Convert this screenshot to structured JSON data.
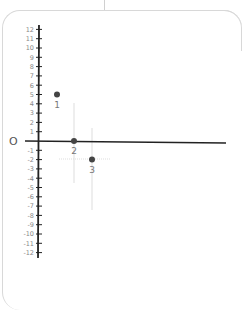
{
  "diagram": {
    "type": "number-line-plot",
    "origin_label": "O",
    "y_ticks": [
      12,
      11,
      10,
      9,
      8,
      7,
      6,
      5,
      4,
      3,
      2,
      1,
      -1,
      -2,
      -3,
      -4,
      -5,
      -6,
      -7,
      -8,
      -9,
      -10,
      -11,
      -12
    ],
    "points": [
      {
        "label": "1",
        "x_px": 57,
        "y_value": 5
      },
      {
        "label": "2",
        "x_px": 74,
        "y_value": 0
      },
      {
        "label": "3",
        "x_px": 92,
        "y_value": -2
      }
    ],
    "colors": {
      "axis": "#222222",
      "point": "#444444",
      "guide": "#dddddd",
      "card_border": "#d8d8d8"
    }
  },
  "chart_data": {
    "type": "scatter",
    "title": "",
    "xlabel": "",
    "ylabel": "",
    "ylim": [
      -12,
      12
    ],
    "y_tick_labels": [
      "12",
      "11",
      "10",
      "9",
      "8",
      "7",
      "6",
      "5",
      "4",
      "3",
      "2",
      "1",
      "-1",
      "-2",
      "-3",
      "-4",
      "-5",
      "-6",
      "-7",
      "-8",
      "-9",
      "-10",
      "-11",
      "-12"
    ],
    "origin_label": "O",
    "series": [
      {
        "name": "points",
        "labels": [
          "1",
          "2",
          "3"
        ],
        "y": [
          5,
          0,
          -2
        ]
      }
    ],
    "grid": false,
    "legend": null
  }
}
